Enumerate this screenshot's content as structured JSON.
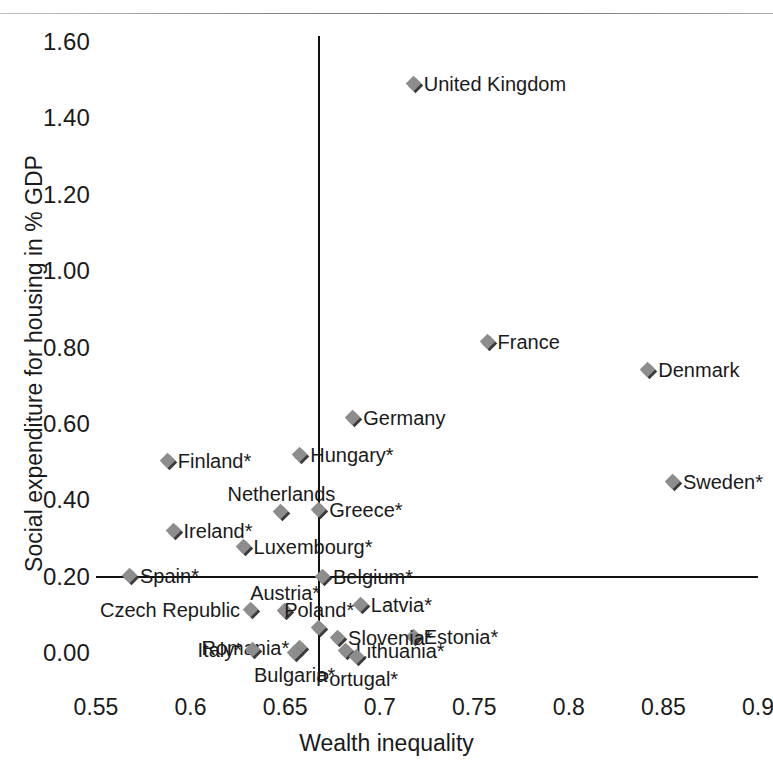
{
  "chart_data": {
    "type": "scatter",
    "title": "",
    "xlabel": "Wealth inequality",
    "ylabel": "Social expenditure for housing in % GDP",
    "xlim": [
      0.55,
      0.9
    ],
    "ylim": [
      0.0,
      1.6
    ],
    "xticks": [
      "0.55",
      "0.6",
      "0.65",
      "0.7",
      "0.75",
      "0.8",
      "0.85",
      "0.9"
    ],
    "xtick_values": [
      0.55,
      0.6,
      0.65,
      0.7,
      0.75,
      0.8,
      0.85,
      0.9
    ],
    "yticks": [
      "0.00",
      "0.20",
      "0.40",
      "0.60",
      "0.80",
      "1.00",
      "1.20",
      "1.40",
      "1.60"
    ],
    "ytick_values": [
      0.0,
      0.2,
      0.4,
      0.6,
      0.8,
      1.0,
      1.2,
      1.4,
      1.6
    ],
    "grid": false,
    "legend": "none",
    "reference_lines": {
      "vertical_x": 0.668,
      "horizontal_y": 0.2
    },
    "marker_color": "#8d8d8d",
    "marker_shadow_color": "#3b3b3b",
    "axis_color": "#111111",
    "points": [
      {
        "label": "United Kingdom",
        "x": 0.718,
        "y": 1.49,
        "label_pos": "right"
      },
      {
        "label": "France",
        "x": 0.757,
        "y": 0.815,
        "label_pos": "right"
      },
      {
        "label": "Denmark",
        "x": 0.842,
        "y": 0.74,
        "label_pos": "right"
      },
      {
        "label": "Germany",
        "x": 0.686,
        "y": 0.615,
        "label_pos": "right"
      },
      {
        "label": "Hungary*",
        "x": 0.658,
        "y": 0.518,
        "label_pos": "right"
      },
      {
        "label": "Finland*",
        "x": 0.588,
        "y": 0.503,
        "label_pos": "right"
      },
      {
        "label": "Sweden*",
        "x": 0.855,
        "y": 0.447,
        "label_pos": "right"
      },
      {
        "label": "Greece*",
        "x": 0.668,
        "y": 0.375,
        "label_pos": "right"
      },
      {
        "label": "Netherlands",
        "x": 0.648,
        "y": 0.368,
        "label_pos": "above"
      },
      {
        "label": "Ireland*",
        "x": 0.591,
        "y": 0.32,
        "label_pos": "right"
      },
      {
        "label": "Luxembourg*",
        "x": 0.628,
        "y": 0.278,
        "label_pos": "right"
      },
      {
        "label": "Spain*",
        "x": 0.568,
        "y": 0.202,
        "label_pos": "right"
      },
      {
        "label": "Belgium*",
        "x": 0.67,
        "y": 0.2,
        "label_pos": "right"
      },
      {
        "label": "Latvia*",
        "x": 0.69,
        "y": 0.127,
        "label_pos": "right"
      },
      {
        "label": "Austria*",
        "x": 0.65,
        "y": 0.11,
        "label_pos": "above"
      },
      {
        "label": "Czech Republic",
        "x": 0.632,
        "y": 0.112,
        "label_pos": "left"
      },
      {
        "label": "Poland*",
        "x": 0.668,
        "y": 0.065,
        "label_pos": "above"
      },
      {
        "label": "Estonia*",
        "x": 0.718,
        "y": 0.042,
        "label_pos": "right"
      },
      {
        "label": "Slovenia*",
        "x": 0.678,
        "y": 0.038,
        "label_pos": "right"
      },
      {
        "label": "Romania*",
        "x": 0.658,
        "y": 0.012,
        "label_pos": "left"
      },
      {
        "label": "Italy*",
        "x": 0.633,
        "y": 0.007,
        "label_pos": "left"
      },
      {
        "label": "Lithuania*",
        "x": 0.682,
        "y": 0.005,
        "label_pos": "right"
      },
      {
        "label": "Bulgaria*",
        "x": 0.655,
        "y": 0.0,
        "label_pos": "below"
      },
      {
        "label": "Portugal*",
        "x": 0.688,
        "y": -0.01,
        "label_pos": "below"
      }
    ]
  },
  "axis": {
    "x_title": "Wealth inequality",
    "y_title": "Social expenditure for housing in % GDP"
  }
}
